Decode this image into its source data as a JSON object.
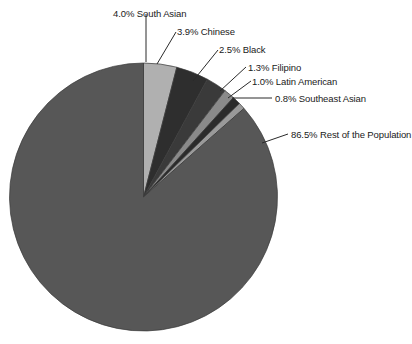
{
  "chart_data": {
    "type": "pie",
    "title": "",
    "subtitle": "",
    "xlabel": "",
    "ylabel": "",
    "legend_position": "callout-labels",
    "grid": false,
    "start_angle_deg": 0,
    "direction": "clockwise",
    "unit": "percent",
    "categories": [
      "South Asian",
      "Chinese",
      "Black",
      "Filipino",
      "Latin American",
      "Southeast Asian",
      "Rest of the Population"
    ],
    "values": [
      4.0,
      3.9,
      2.5,
      1.3,
      1.0,
      0.8,
      86.5
    ],
    "slices": [
      {
        "label": "4.0% South Asian",
        "name": "South Asian",
        "value": 4.0,
        "color": "#b0b0b0"
      },
      {
        "label": "3.9% Chinese",
        "name": "Chinese",
        "value": 3.9,
        "color": "#2e2e2e"
      },
      {
        "label": "2.5% Black",
        "name": "Black",
        "value": 2.5,
        "color": "#3a3a3a"
      },
      {
        "label": "1.3% Filipino",
        "name": "Filipino",
        "value": 1.3,
        "color": "#8a8a8a"
      },
      {
        "label": "1.0% Latin American",
        "name": "Latin American",
        "value": 1.0,
        "color": "#2b2b2b"
      },
      {
        "label": "0.8% Southeast Asian",
        "name": "Southeast Asian",
        "value": 0.8,
        "color": "#9a9a9a"
      },
      {
        "label": "86.5% Rest of the Population",
        "name": "Rest of the Population",
        "value": 86.5,
        "color": "#575757"
      }
    ]
  },
  "labels": {
    "south_asian": "4.0% South Asian",
    "chinese": "3.9% Chinese",
    "black": "2.5% Black",
    "filipino": "1.3% Filipino",
    "latin_american": "1.0% Latin American",
    "southeast_asian": "0.8% Southeast Asian",
    "rest": "86.5% Rest of the Population"
  },
  "colors": {
    "background": "#ffffff",
    "text": "#1a1a1a",
    "leader_line": "#2a2a2a",
    "slice_outline": "#3a3a3a"
  }
}
